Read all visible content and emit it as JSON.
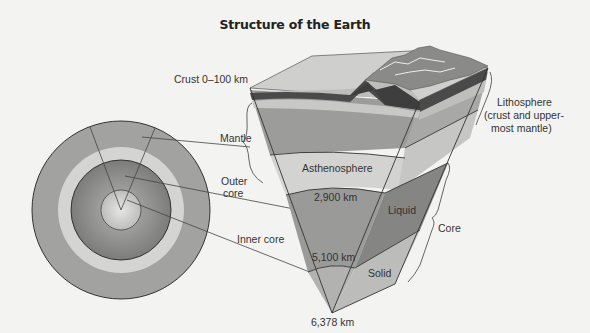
{
  "title": "Structure of the Earth",
  "labels": {
    "crust": "Crust 0–100 km",
    "mantle": "Mantle",
    "outer_core_1": "Outer",
    "outer_core_2": "core",
    "inner_core": "Inner core",
    "asthenosphere": "Asthenosphere",
    "depth_2900": "2,900 km",
    "liquid": "Liquid",
    "depth_5100": "5,100 km",
    "solid": "Solid",
    "depth_6378": "6,378 km",
    "lithosphere_1": "Lithosphere",
    "lithosphere_2": "(crust and upper-",
    "lithosphere_3": "most mantle)",
    "core": "Core"
  },
  "colors": {
    "background": "#f3f3f1",
    "mantle": "#9c9c9a",
    "asthenosphere": "#d2d2d0",
    "outer_core": "#8a8a88",
    "inner_core": "#c8c8c6",
    "crust_dark": "#4a4a4a",
    "lines": "#3a3a3a"
  }
}
